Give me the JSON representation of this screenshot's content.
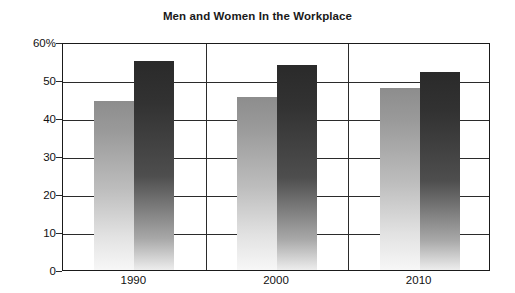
{
  "chart_data": {
    "type": "bar",
    "title": "Men and Women In the Workplace",
    "xlabel": "",
    "ylabel": "",
    "categories": [
      "1990",
      "2000",
      "2010"
    ],
    "series": [
      {
        "name": "light-series",
        "values": [
          44.5,
          45.5,
          47.8
        ]
      },
      {
        "name": "dark-series",
        "values": [
          55.0,
          54.0,
          52.2
        ]
      }
    ],
    "ylim": [
      0,
      60
    ],
    "ytick_values": [
      0,
      10,
      20,
      30,
      40,
      50,
      60
    ],
    "ytick_labels": [
      "0",
      "10",
      "20",
      "30",
      "40",
      "50",
      "60%"
    ],
    "grid": true,
    "legend": "none",
    "unit": "%"
  },
  "title": "Men and Women In the Workplace",
  "axis": {
    "y_labels": [
      "60%",
      "50",
      "40",
      "30",
      "20",
      "10",
      "0"
    ],
    "x_labels": [
      "1990",
      "2000",
      "2010"
    ]
  }
}
